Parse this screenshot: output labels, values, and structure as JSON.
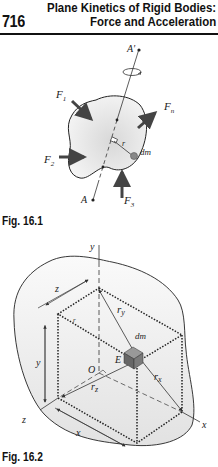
{
  "header": {
    "page_number": "716",
    "title_line1": "Plane Kinetics of Rigid Bodies:",
    "title_line2": "Force and Acceleration"
  },
  "figure1": {
    "caption": "Fig. 16.1",
    "labels": {
      "A_prime": "A′",
      "A": "A",
      "F1": "F",
      "F1_sub": "1",
      "F2": "F",
      "F2_sub": "2",
      "F3": "F",
      "F3_sub": "3",
      "Fn": "F",
      "Fn_sub": "n",
      "r": "r",
      "dm": "dm"
    }
  },
  "figure2": {
    "caption": "Fig. 16.2",
    "labels": {
      "y_axis": "y",
      "z_axis": "z",
      "x_axis": "x",
      "z_dim": "z",
      "y_dim": "y",
      "x_dim": "x",
      "r_y": "r",
      "r_y_sub": "y",
      "r_x": "r",
      "r_x_sub": "x",
      "r_z": "r",
      "r_z_sub": "z",
      "dm": "dm",
      "E": "E",
      "O": "O",
      "r": "r"
    }
  },
  "colors": {
    "body_fill": "#e6e6e6",
    "element_fill": "#777777",
    "ink": "#111111"
  }
}
